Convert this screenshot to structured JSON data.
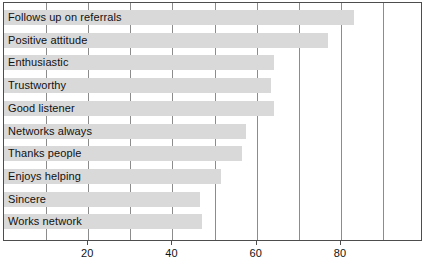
{
  "chart_data": {
    "type": "bar",
    "orientation": "horizontal",
    "title": "",
    "xlabel": "",
    "ylabel": "",
    "xlim": [
      0,
      99
    ],
    "xticks": [
      20,
      40,
      60,
      80
    ],
    "xtick_labels": [
      "20",
      "40",
      "60",
      "80"
    ],
    "grid": true,
    "legend": "none",
    "bar_color": "#d9d9d9",
    "categories": [
      "Follows up on referrals",
      "Positive attitude",
      "Enthusiastic",
      "Trustworthy",
      "Good listener",
      "Networks always",
      "Thanks people",
      "Enjoys helping",
      "Sincere",
      "Works network"
    ],
    "values": [
      83,
      77,
      64,
      63.5,
      64,
      57.5,
      56.5,
      51.5,
      46.5,
      47
    ]
  }
}
